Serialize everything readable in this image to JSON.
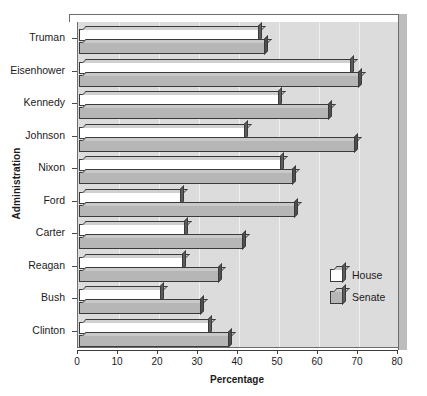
{
  "chart_data": {
    "type": "bar",
    "orientation": "horizontal",
    "title": "",
    "xlabel": "Percentage",
    "ylabel": "Administration",
    "xlim": [
      0,
      80
    ],
    "xticks": [
      0,
      10,
      20,
      30,
      40,
      50,
      60,
      70,
      80
    ],
    "grid": true,
    "legend_position": "inside-lower-right",
    "categories": [
      "Truman",
      "Eisenhower",
      "Kennedy",
      "Johnson",
      "Nixon",
      "Ford",
      "Carter",
      "Reagan",
      "Bush",
      "Clinton"
    ],
    "series": [
      {
        "name": "House",
        "color": "#ffffff",
        "values": [
          45.0,
          68.0,
          50.0,
          41.5,
          50.5,
          25.5,
          26.5,
          26.0,
          20.5,
          32.5
        ]
      },
      {
        "name": "Senate",
        "color": "#b6b6b6",
        "values": [
          46.5,
          70.0,
          62.5,
          69.0,
          53.5,
          54.0,
          41.0,
          35.0,
          30.5,
          37.5
        ]
      }
    ]
  },
  "legend": {
    "entries": [
      {
        "label": "House",
        "swatch": "house-swatch"
      },
      {
        "label": "Senate",
        "swatch": "senate-swatch"
      }
    ]
  }
}
